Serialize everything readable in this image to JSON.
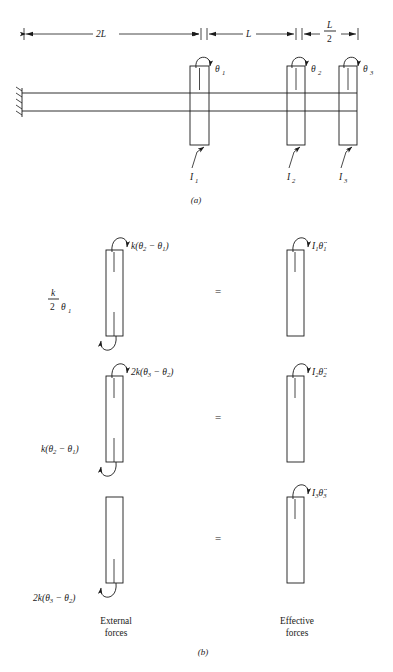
{
  "figure": {
    "panel_a_label": "(a)",
    "panel_b_label": "(b)",
    "dimensions": [
      {
        "id": "dim-2l",
        "text": "2L"
      },
      {
        "id": "dim-l",
        "text": "L"
      },
      {
        "id": "dim-l-over-2",
        "numerator": "L",
        "denominator": "2"
      }
    ],
    "shaft": {
      "support": "fixed-wall-hatched",
      "discs": [
        {
          "id": "disc-1",
          "rotation_label": "θ",
          "rotation_sub": "1",
          "inertia_label": "I",
          "inertia_sub": "1"
        },
        {
          "id": "disc-2",
          "rotation_label": "θ",
          "rotation_sub": "2",
          "inertia_label": "I",
          "inertia_sub": "2"
        },
        {
          "id": "disc-3",
          "rotation_label": "θ",
          "rotation_sub": "3",
          "inertia_label": "I",
          "inertia_sub": "3"
        }
      ]
    },
    "fbd": {
      "external_caption_line1": "External",
      "external_caption_line2": "forces",
      "effective_caption_line1": "Effective",
      "effective_caption_line2": "forces",
      "equals": "=",
      "rows": [
        {
          "id": "fbd-row-1",
          "top_torque": "k(θ₂ − θ₁)",
          "bottom_torque": "(k/2)θ₁",
          "effective_torque": "I₁θ̈₁"
        },
        {
          "id": "fbd-row-2",
          "top_torque": "2k(θ₃ − θ₂)",
          "bottom_torque": "k(θ₂ − θ₁)",
          "effective_torque": "I₂θ̈₂"
        },
        {
          "id": "fbd-row-3",
          "top_torque": "",
          "bottom_torque": "2k(θ₃ − θ₂)",
          "effective_torque": "I₃θ̈₃"
        }
      ]
    },
    "glyphs": {
      "k": "k",
      "two_k": "2k",
      "theta": "θ",
      "I": "I",
      "minus": "−",
      "lparen": "(",
      "rparen": ")",
      "two": "2",
      "three": "3",
      "one": "1",
      "L": "L",
      "twoL": "2L"
    },
    "colors": {
      "ink": "#1a1a1a",
      "background": "#ffffff"
    }
  }
}
